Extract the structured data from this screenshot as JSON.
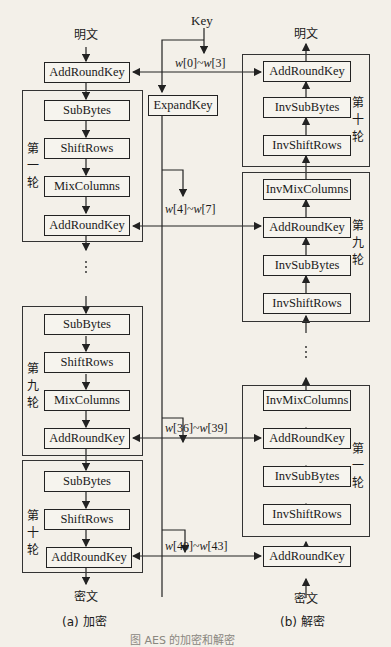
{
  "diagram": {
    "key_label": "Key",
    "expand_key": "ExpandKey",
    "key_words": [
      {
        "prefix": "w",
        "from": "[0]",
        "sep": "~",
        "prefix2": "w",
        "to": "[3]"
      },
      {
        "prefix": "w",
        "from": "[4]",
        "sep": "~",
        "prefix2": "w",
        "to": "[7]"
      },
      {
        "prefix": "w",
        "from": "[36]",
        "sep": "~",
        "prefix2": "w",
        "to": "[39]"
      },
      {
        "prefix": "w",
        "from": "[40]",
        "sep": "~",
        "prefix2": "w",
        "to": "[43]"
      }
    ],
    "encryption": {
      "input": "明文",
      "output": "密文",
      "caption": "(a) 加密",
      "initial": "AddRoundKey",
      "round1": {
        "label": [
          "第",
          "一",
          "轮"
        ],
        "steps": [
          "SubBytes",
          "ShiftRows",
          "MixColumns",
          "AddRoundKey"
        ]
      },
      "ellipsis": "⋮",
      "round9": {
        "label": [
          "第",
          "九",
          "轮"
        ],
        "steps": [
          "SubBytes",
          "ShiftRows",
          "MixColumns",
          "AddRoundKey"
        ]
      },
      "round10": {
        "label": [
          "第",
          "十",
          "轮"
        ],
        "steps": [
          "SubBytes",
          "ShiftRows",
          "AddRoundKey"
        ]
      }
    },
    "decryption": {
      "input": "密文",
      "output": "明文",
      "caption": "(b) 解密",
      "initial": "AddRoundKey",
      "round10": {
        "label": [
          "第",
          "十",
          "轮"
        ],
        "steps": [
          "AddRoundKey",
          "InvSubBytes",
          "InvShiftRows"
        ]
      },
      "round9": {
        "label": [
          "第",
          "九",
          "轮"
        ],
        "steps": [
          "InvMixColumns",
          "AddRoundKey",
          "InvSubBytes",
          "InvShiftRows"
        ]
      },
      "ellipsis": "⋮",
      "round1": {
        "label": [
          "第",
          "一",
          "轮"
        ],
        "steps": [
          "InvMixColumns",
          "AddRoundKey",
          "InvSubBytes",
          "InvShiftRows"
        ]
      }
    },
    "figure_caption": "图 AES 的加密和解密"
  }
}
